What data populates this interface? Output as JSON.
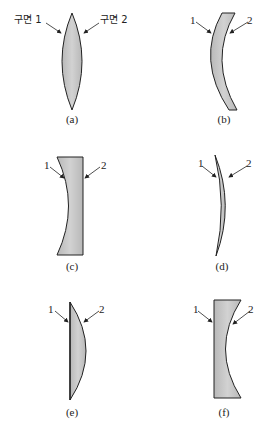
{
  "diagram": {
    "title": "",
    "fill_color": "#c4c4c4",
    "stroke_color": "#222222",
    "panels": [
      {
        "id": "a",
        "caption": "(a)",
        "surface1_label": "구면 1",
        "surface2_label": "구면 2",
        "shape": "biconvex"
      },
      {
        "id": "b",
        "caption": "(b)",
        "surface1_label": "1",
        "surface2_label": "2",
        "shape": "meniscus-thick"
      },
      {
        "id": "c",
        "caption": "(c)",
        "surface1_label": "1",
        "surface2_label": "2",
        "shape": "plano-concave (concave left)"
      },
      {
        "id": "d",
        "caption": "(d)",
        "surface1_label": "1",
        "surface2_label": "2",
        "shape": "meniscus-thin"
      },
      {
        "id": "e",
        "caption": "(e)",
        "surface1_label": "1",
        "surface2_label": "2",
        "shape": "plano-convex (convex right)"
      },
      {
        "id": "f",
        "caption": "(f)",
        "surface1_label": "1",
        "surface2_label": "2",
        "shape": "plano-concave (concave right)"
      }
    ]
  }
}
